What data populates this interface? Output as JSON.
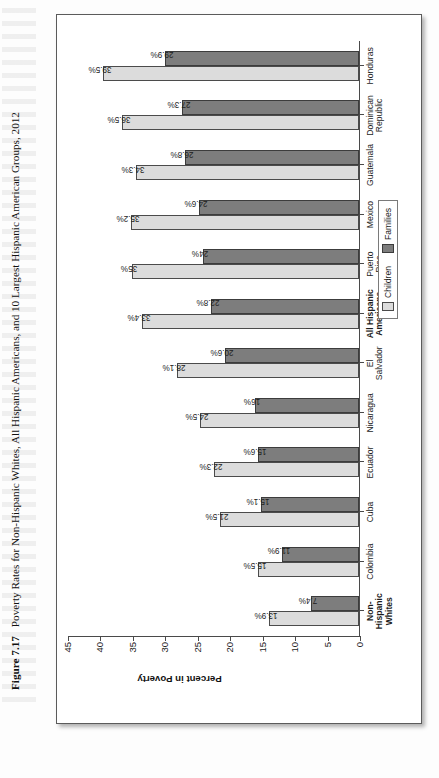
{
  "caption": {
    "label": "Figure 7.17",
    "text": "Poverty Rates for Non-Hispanic Whites, All Hispanic Americans, and 10 Largest Hispanic American Groups, 2012"
  },
  "legend": {
    "children_label": "Children",
    "families_label": "Families"
  },
  "colors": {
    "children": "#dcdcdc",
    "families": "#7d7d7d",
    "axis": "#4a4a4a"
  },
  "chart_data": {
    "type": "bar",
    "title": "Poverty Rates for Non-Hispanic Whites, All Hispanic Americans, and 10 Largest Hispanic American Groups, 2012",
    "xlabel": "",
    "ylabel": "Percent in Poverty",
    "ylim": [
      0,
      45
    ],
    "yticks": [
      0,
      5,
      10,
      15,
      20,
      25,
      30,
      35,
      40,
      45
    ],
    "grid": false,
    "legend_position": "bottom-right",
    "orientation": "vertical",
    "categories": [
      "Non-Hispanic Whites",
      "Colombia",
      "Cuba",
      "Ecuador",
      "Nicaragua",
      "El Salvador",
      "All Hispanic Americans",
      "Puerto Rico",
      "Mexico",
      "Guatemala",
      "Dominican Republic",
      "Honduras"
    ],
    "category_lines": [
      [
        "Non-",
        "Hispanic",
        "Whites"
      ],
      [
        "Colombia"
      ],
      [
        "Cuba"
      ],
      [
        "Ecuador"
      ],
      [
        "Nicaragua"
      ],
      [
        "El",
        "Salvador"
      ],
      [
        "All Hispanic",
        "Americans"
      ],
      [
        "Puerto",
        "Rico"
      ],
      [
        "Mexico"
      ],
      [
        "Guatemala"
      ],
      [
        "Dominican",
        "Republic"
      ],
      [
        "Honduras"
      ]
    ],
    "bold_categories": [
      "Non-Hispanic Whites",
      "All Hispanic Americans"
    ],
    "series": [
      {
        "name": "Children",
        "color": "#dcdcdc",
        "values": [
          13.9,
          15.5,
          21.5,
          22.3,
          24.5,
          28.1,
          33.4,
          35.0,
          35.2,
          34.3,
          36.5,
          39.5
        ],
        "labels": [
          "13.9%",
          "15.5%",
          "21.5%",
          "22.3%",
          "24.5%",
          "28.1%",
          "33.4%",
          "35%",
          "35.2%",
          "34.3%",
          "36.5%",
          "39.5%"
        ]
      },
      {
        "name": "Families",
        "color": "#7d7d7d",
        "values": [
          7.4,
          11.9,
          15.1,
          15.6,
          16.0,
          20.6,
          22.8,
          24.0,
          24.6,
          26.8,
          27.3,
          29.9
        ],
        "labels": [
          "7.4%",
          "11.9%",
          "15.1%",
          "15.6%",
          "16%",
          "20.6%",
          "22.8%",
          "24%",
          "24.6%",
          "26.8%",
          "27.3%",
          "29.9%"
        ]
      }
    ]
  }
}
